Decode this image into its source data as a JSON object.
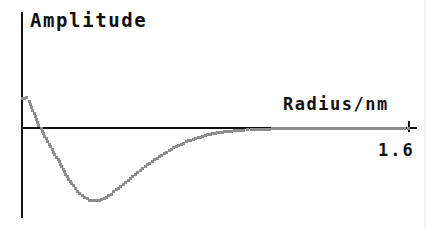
{
  "figure": {
    "background": "#ffffff",
    "axis_color": "#111111",
    "marker_color": "#8d8d8d",
    "y_axis_label": "Amplitude",
    "x_axis_label": "Radius/nm",
    "x_tick_label": "1.6",
    "tick_mark": "axis-end-tick"
  },
  "chart_data": {
    "type": "scatter",
    "title": "",
    "xlabel": "Radius/nm",
    "ylabel": "Amplitude",
    "xlim": [
      0,
      1.6
    ],
    "ylim": [
      -1.0,
      0.42
    ],
    "grid": false,
    "legend": null,
    "marker": "small-square-dot",
    "marker_color": "#8d8d8d",
    "annotations": [
      {
        "text": "Amplitude",
        "role": "y-axis-label"
      },
      {
        "text": "Radius/nm",
        "role": "x-axis-label"
      },
      {
        "text": "1.6",
        "role": "x-axis-max-tick"
      }
    ],
    "series": [
      {
        "name": "amplitude",
        "x": [
          0.0,
          0.02,
          0.03,
          0.05,
          0.07,
          0.08,
          0.1,
          0.12,
          0.13,
          0.15,
          0.17,
          0.18,
          0.2,
          0.22,
          0.23,
          0.25,
          0.27,
          0.28,
          0.3,
          0.32,
          0.33,
          0.35,
          0.37,
          0.38,
          0.4,
          0.42,
          0.43,
          0.45,
          0.47,
          0.48,
          0.5,
          0.52,
          0.53,
          0.55,
          0.57,
          0.58,
          0.6,
          0.62,
          0.63,
          0.65,
          0.67,
          0.68,
          0.7,
          0.72,
          0.73,
          0.75,
          0.77,
          0.78,
          0.8,
          0.82,
          0.83,
          0.85,
          0.87,
          0.88,
          0.9,
          0.92,
          0.95,
          1.0,
          1.05,
          1.1,
          1.2,
          1.3,
          1.4,
          1.5,
          1.6
        ],
        "y": [
          0.39,
          0.41,
          0.36,
          0.2,
          0.03,
          -0.01,
          -0.14,
          -0.25,
          -0.32,
          -0.42,
          -0.55,
          -0.62,
          -0.71,
          -0.8,
          -0.85,
          -0.9,
          -0.94,
          -0.96,
          -0.97,
          -0.96,
          -0.95,
          -0.92,
          -0.88,
          -0.85,
          -0.8,
          -0.75,
          -0.72,
          -0.67,
          -0.62,
          -0.59,
          -0.54,
          -0.49,
          -0.47,
          -0.42,
          -0.38,
          -0.36,
          -0.32,
          -0.28,
          -0.26,
          -0.23,
          -0.2,
          -0.18,
          -0.16,
          -0.14,
          -0.13,
          -0.11,
          -0.09,
          -0.08,
          -0.07,
          -0.06,
          -0.055,
          -0.05,
          -0.04,
          -0.035,
          -0.03,
          -0.028,
          -0.02,
          -0.015,
          -0.012,
          -0.01,
          -0.006,
          -0.004,
          -0.003,
          -0.002,
          -0.001
        ]
      }
    ],
    "pixel_geometry": {
      "origin_px": [
        22,
        128
      ],
      "x_axis_end_px": [
        409,
        128
      ],
      "y_axis_top_px": [
        22,
        12
      ],
      "y_axis_bottom_px": [
        22,
        218
      ],
      "x_px_per_unit": 241.25,
      "y_px_zero": 128,
      "y_px_per_unit": 75
    }
  }
}
